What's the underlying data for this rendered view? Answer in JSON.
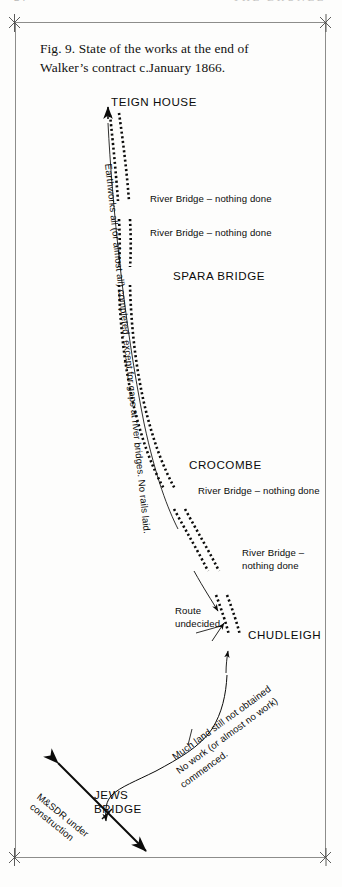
{
  "page": {
    "running_head_left": "24",
    "running_head_right": "THE BRUNEL"
  },
  "figure": {
    "caption_line1": "Fig. 9. State of the works at the end of",
    "caption_line2": "Walker’s contract c.January 1866."
  },
  "map": {
    "places": [
      {
        "id": "teign-house",
        "label": "TEIGN HOUSE"
      },
      {
        "id": "spara-bridge",
        "label": "SPARA BRIDGE"
      },
      {
        "id": "crocombe",
        "label": "CROCOMBE"
      },
      {
        "id": "chudleigh",
        "label": "CHUDLEIGH"
      },
      {
        "id": "jews-bridge",
        "label_line1": "JEWS",
        "label_line2": "BRIDGE"
      }
    ],
    "annotations": {
      "river_bridge_1": "River Bridge – nothing done",
      "river_bridge_2": "River Bridge – nothing done",
      "river_bridge_3": "River Bridge – nothing done",
      "river_bridge_4_line1": "River Bridge –",
      "river_bridge_4_line2": "nothing done",
      "route_undecided_line1": "Route",
      "route_undecided_line2": "undecided",
      "earthworks_note": "Earthworks all (or almost all) completed, except for gaps at river bridges. No rails laid.",
      "land_note_line1": "Much land still not obtained",
      "land_note_line2": "No work (or almost no work)",
      "land_note_line3": "commenced.",
      "msdr_line1": "M&SDR under",
      "msdr_line2": "construction"
    },
    "colors": {
      "ink": "#0b0b0a",
      "paper": "#fdfdfc",
      "frame": "#8d8d8b"
    }
  }
}
